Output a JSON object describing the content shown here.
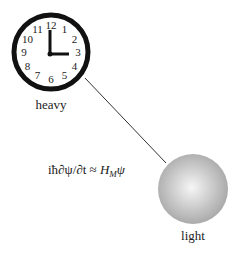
{
  "diagram": {
    "clock": {
      "numbers": [
        "12",
        "1",
        "2",
        "3",
        "4",
        "5",
        "6",
        "7",
        "8",
        "9",
        "10",
        "11"
      ],
      "time": "3:00",
      "label": "heavy"
    },
    "sphere": {
      "label": "light"
    },
    "equation": {
      "lhs": "iħ∂ψ/∂t",
      "relation": "≈",
      "rhs_symbol": "H",
      "rhs_subscript": "M",
      "rhs_tail": "ψ"
    },
    "colors": {
      "clock_rim": "#111111",
      "sphere_light": "#f4f4f4",
      "sphere_dark": "#a8a8a8",
      "line": "#333333"
    }
  }
}
